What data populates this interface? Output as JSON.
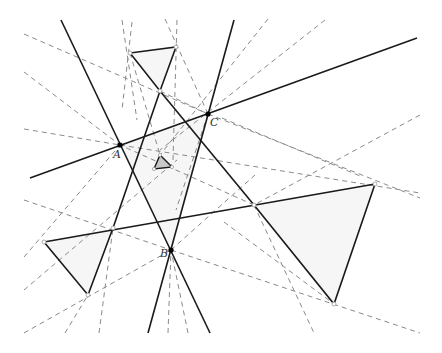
{
  "diagram": {
    "title": "",
    "labels": [
      {
        "id": "A",
        "text": "A",
        "x": 113,
        "y": 158
      },
      {
        "id": "B",
        "text": "B",
        "x": 160,
        "y": 257
      },
      {
        "id": "C",
        "text": "C",
        "x": 210,
        "y": 126
      }
    ],
    "points": {
      "A": [
        120,
        145
      ],
      "B": [
        171,
        250
      ],
      "C": [
        208,
        114
      ]
    },
    "solid_lines": [
      {
        "name": "line-AC",
        "from": [
          30,
          178
        ],
        "to": [
          417,
          38
        ]
      },
      {
        "name": "line-AB",
        "from": [
          61,
          20
        ],
        "to": [
          210,
          333
        ]
      },
      {
        "name": "line-CB",
        "from": [
          234,
          20
        ],
        "to": [
          148,
          333
        ]
      }
    ],
    "triangles": [
      {
        "name": "top-triangle",
        "vertices": [
          [
            130,
            53
          ],
          [
            176,
            47
          ],
          [
            160,
            91
          ]
        ]
      },
      {
        "name": "right-triangle",
        "vertices": [
          [
            254,
            205
          ],
          [
            375,
            184
          ],
          [
            334,
            304
          ]
        ]
      },
      {
        "name": "left-triangle",
        "vertices": [
          [
            44,
            242
          ],
          [
            113,
            228
          ],
          [
            88,
            295
          ]
        ]
      },
      {
        "name": "central-shaded-triangle",
        "vertices": [
          [
            160,
            155
          ],
          [
            172,
            167
          ],
          [
            154,
            169
          ]
        ]
      }
    ],
    "colors": {
      "solid": "#1a1a1a",
      "dashed": "#8a8a8a",
      "shade": "#c8c8c8",
      "background": "#ffffff"
    }
  }
}
